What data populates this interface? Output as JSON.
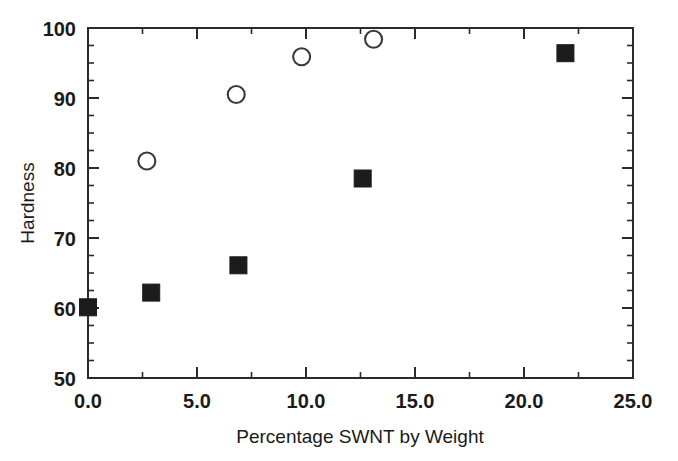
{
  "chart_data": {
    "type": "scatter",
    "title": "",
    "xlabel": "Percentage SWNT by Weight",
    "ylabel": "Hardness",
    "xlim": [
      0.0,
      25.0
    ],
    "ylim": [
      50,
      100
    ],
    "grid": false,
    "legend": "none",
    "x_ticks": [
      {
        "value": 0.0,
        "label": "0.0"
      },
      {
        "value": 5.0,
        "label": "5.0"
      },
      {
        "value": 10.0,
        "label": "10.0"
      },
      {
        "value": 15.0,
        "label": "15.0"
      },
      {
        "value": 20.0,
        "label": "20.0"
      },
      {
        "value": 25.0,
        "label": "25.0"
      }
    ],
    "y_ticks": [
      {
        "value": 50,
        "label": "50"
      },
      {
        "value": 60,
        "label": "60"
      },
      {
        "value": 70,
        "label": "70"
      },
      {
        "value": 80,
        "label": "80"
      },
      {
        "value": 90,
        "label": "90"
      },
      {
        "value": 100,
        "label": "100"
      }
    ],
    "x_minor_step": 2.5,
    "y_minor_step": 2.5,
    "series": [
      {
        "name": "filled-square-series",
        "marker": "filled-square",
        "color": "#1c1c1c",
        "points": [
          {
            "x": 0.0,
            "y": 60.1
          },
          {
            "x": 2.9,
            "y": 62.2
          },
          {
            "x": 6.9,
            "y": 66.1
          },
          {
            "x": 12.6,
            "y": 78.5
          },
          {
            "x": 21.9,
            "y": 96.4
          }
        ]
      },
      {
        "name": "open-circle-series",
        "marker": "open-circle",
        "color": "#3a3a3a",
        "points": [
          {
            "x": 2.7,
            "y": 81.0
          },
          {
            "x": 6.8,
            "y": 90.5
          },
          {
            "x": 9.8,
            "y": 95.9
          },
          {
            "x": 13.1,
            "y": 98.4
          }
        ]
      }
    ]
  },
  "axis_titles": {
    "x": "Percentage SWNT by Weight",
    "y": "Hardness"
  }
}
